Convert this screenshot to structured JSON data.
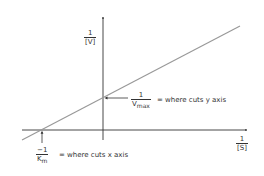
{
  "y_axis": {
    "numerator": "1",
    "denominator": "[V]"
  },
  "x_axis": {
    "numerator": "1",
    "denominator": "[S]"
  },
  "y_intercept": {
    "numerator": "1",
    "denominator": "V",
    "denominator_sub": "max",
    "text": "= where cuts y axis"
  },
  "x_intercept": {
    "numerator": "−1",
    "denominator": "K",
    "denominator_sub": "m",
    "text": "= where cuts x axis"
  },
  "colors": {
    "axis": "#333333",
    "line": "#999999",
    "text": "#333333"
  }
}
